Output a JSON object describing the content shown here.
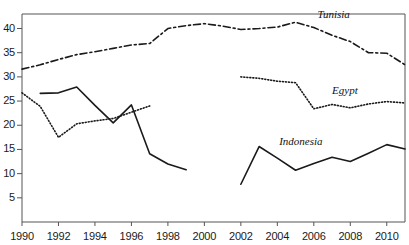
{
  "chart_data": {
    "type": "line",
    "title": "",
    "subtitle": "",
    "xlabel": "",
    "ylabel": "",
    "xlim": [
      1990,
      2011
    ],
    "ylim": [
      0,
      43
    ],
    "grid": false,
    "legend_position": "inline-end-of-line",
    "x_ticks": [
      1990,
      1992,
      1994,
      1996,
      1998,
      2000,
      2002,
      2004,
      2006,
      2008,
      2010
    ],
    "y_ticks": [
      5,
      10,
      15,
      20,
      25,
      30,
      35,
      40
    ],
    "x_tick_labels": [
      "1990",
      "1992",
      "1994",
      "1996",
      "1998",
      "2000",
      "2002",
      "2004",
      "2006",
      "2008",
      "2010"
    ],
    "y_tick_labels": [
      "5",
      "10",
      "15",
      "20",
      "25",
      "30",
      "35",
      "40"
    ],
    "series": [
      {
        "name": "Tunisia",
        "style": "dash-dot",
        "color": "#1a1a1a",
        "label": "Tunisia",
        "x": [
          1990,
          1991,
          1992,
          1993,
          1994,
          1995,
          1996,
          1997,
          1998,
          1999,
          2000,
          2001,
          2002,
          2003,
          2004,
          2005,
          2006,
          2007,
          2008,
          2009,
          2010,
          2011
        ],
        "values": [
          31.6,
          32.5,
          33.6,
          34.6,
          35.2,
          35.9,
          36.6,
          36.9,
          40.0,
          40.6,
          41.0,
          40.5,
          39.8,
          40.0,
          40.3,
          41.3,
          40.2,
          38.6,
          37.3,
          35.0,
          34.9,
          32.5
        ]
      },
      {
        "name": "Egypt",
        "style": "dotted",
        "color": "#1a1a1a",
        "label": "Egypt",
        "segments": [
          {
            "x": [
              1990,
              1991,
              1992,
              1993,
              1994,
              1995,
              1996,
              1997
            ],
            "values": [
              26.7,
              23.9,
              17.5,
              20.3,
              20.9,
              21.4,
              22.7,
              24.0
            ]
          },
          {
            "x": [
              2002,
              2003,
              2004,
              2005,
              2006,
              2007,
              2008,
              2009,
              2010,
              2011
            ],
            "values": [
              30.0,
              29.7,
              29.1,
              28.8,
              23.4,
              24.3,
              23.6,
              24.4,
              24.9,
              24.6
            ]
          }
        ]
      },
      {
        "name": "Indonesia",
        "style": "solid",
        "color": "#1a1a1a",
        "label": "Indonesia",
        "segments": [
          {
            "x": [
              1991,
              1992,
              1993,
              1994,
              1995,
              1996,
              1997,
              1998,
              1999
            ],
            "values": [
              26.6,
              26.7,
              27.9,
              24.1,
              20.5,
              24.2,
              14.1,
              12.0,
              10.8
            ]
          },
          {
            "x": [
              2002,
              2003,
              2004,
              2005,
              2006,
              2007,
              2008,
              2009,
              2010,
              2011
            ],
            "values": [
              7.8,
              15.6,
              13.2,
              10.7,
              12.1,
              13.4,
              12.5,
              14.2,
              16.0,
              15.1
            ]
          }
        ]
      }
    ],
    "series_label_positions": [
      {
        "name": "Tunisia",
        "x": 2006.2,
        "y": 42.6
      },
      {
        "name": "Egypt",
        "x": 2007.0,
        "y": 26.9
      },
      {
        "name": "Indonesia",
        "x": 2004.1,
        "y": 16.3
      }
    ]
  },
  "axis": {
    "axis_color": "#555555",
    "tick_color": "#555555",
    "text_color": "#1a1a1a",
    "background": "#ffffff"
  }
}
